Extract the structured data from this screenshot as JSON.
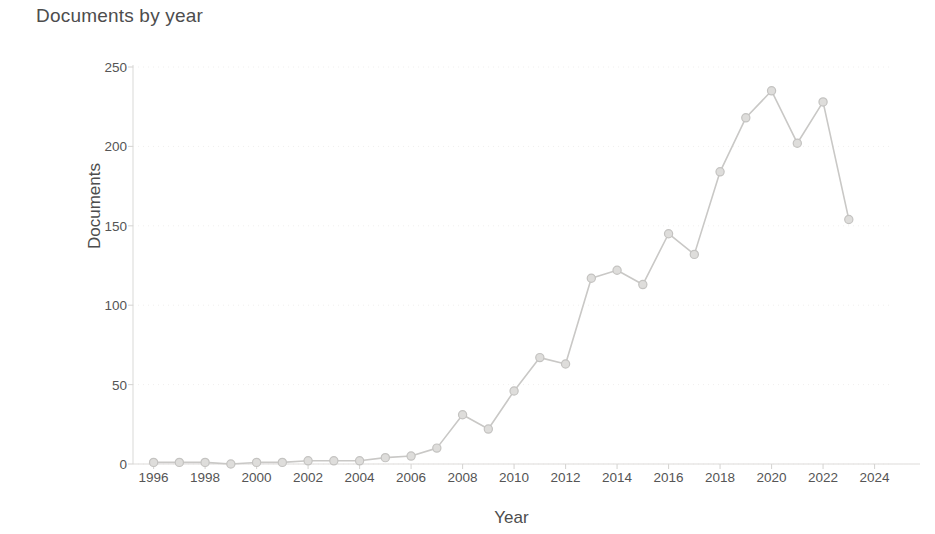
{
  "chart_data": {
    "type": "line",
    "title": "Documents by year",
    "xlabel": "Year",
    "ylabel": "Documents",
    "xlim": [
      1995.2,
      2024.6
    ],
    "ylim": [
      0,
      250
    ],
    "grid": true,
    "legend": null,
    "xticks": [
      1996,
      1998,
      2000,
      2002,
      2004,
      2006,
      2008,
      2010,
      2012,
      2014,
      2016,
      2018,
      2020,
      2022,
      2024
    ],
    "yticks": [
      0,
      50,
      100,
      150,
      200,
      250
    ],
    "x": [
      1996,
      1997,
      1998,
      1999,
      2000,
      2001,
      2002,
      2003,
      2004,
      2005,
      2006,
      2007,
      2008,
      2009,
      2010,
      2011,
      2012,
      2013,
      2014,
      2015,
      2016,
      2017,
      2018,
      2019,
      2020,
      2021,
      2022,
      2023
    ],
    "values": [
      1,
      1,
      1,
      0,
      1,
      1,
      2,
      2,
      2,
      4,
      5,
      10,
      31,
      22,
      46,
      67,
      63,
      117,
      122,
      113,
      145,
      132,
      184,
      218,
      235,
      202,
      228,
      154
    ],
    "series": [
      {
        "name": "Documents",
        "marker": "circle",
        "color": "#c9c8c6",
        "values": [
          1,
          1,
          1,
          0,
          1,
          1,
          2,
          2,
          2,
          4,
          5,
          10,
          31,
          22,
          46,
          67,
          63,
          117,
          122,
          113,
          145,
          132,
          184,
          218,
          235,
          202,
          228,
          154
        ]
      }
    ]
  },
  "style": {
    "line_color": "#c9c8c6",
    "marker_fill": "#dedddb",
    "marker_stroke": "#c4c3c1",
    "grid_color": "#f0efee",
    "axis_color": "#dddcda",
    "text_color": "#4d4d4d",
    "background": "#ffffff"
  }
}
